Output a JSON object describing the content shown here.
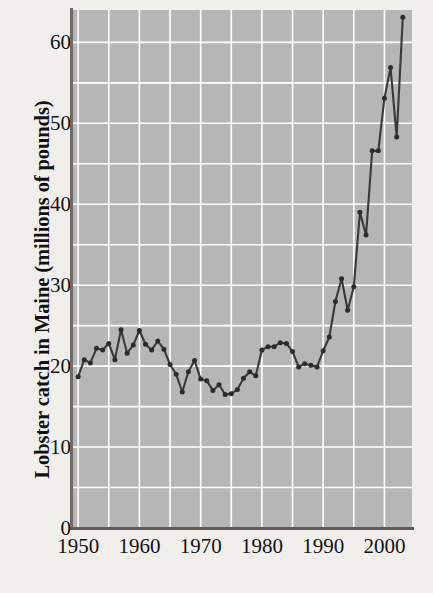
{
  "figure": {
    "background_color": "#f1efec",
    "plot_background_color": "#b6b6b6",
    "gridline_color": "#ffffff",
    "line_color": "#3b3936",
    "marker_color": "#2e2c2a",
    "axis_color": "#5f5c59"
  },
  "axis": {
    "y_title": "Lobster catch in Maine (millions of pounds)",
    "x_title": "",
    "y_ticks": [
      "0",
      "10",
      "20",
      "30",
      "40",
      "50",
      "60"
    ],
    "x_ticks": [
      "1950",
      "1960",
      "1970",
      "1980",
      "1990",
      "2000"
    ]
  },
  "chart_data": {
    "type": "line",
    "title": "",
    "xlabel": "",
    "ylabel": "Lobster catch in Maine (millions of pounds)",
    "xlim": [
      1949,
      2004.5
    ],
    "ylim": [
      0,
      64
    ],
    "yticks": [
      0,
      10,
      20,
      30,
      40,
      50,
      60
    ],
    "xticks": [
      1950,
      1960,
      1970,
      1980,
      1990,
      2000
    ],
    "y_minor_step": 5,
    "x_minor_step": 5,
    "grid": true,
    "legend": false,
    "markers": true,
    "series": [
      {
        "name": "Lobster catch",
        "x": [
          1950,
          1951,
          1952,
          1953,
          1954,
          1955,
          1956,
          1957,
          1958,
          1959,
          1960,
          1961,
          1962,
          1963,
          1964,
          1965,
          1966,
          1967,
          1968,
          1969,
          1970,
          1971,
          1972,
          1973,
          1974,
          1975,
          1976,
          1977,
          1978,
          1979,
          1980,
          1981,
          1982,
          1983,
          1984,
          1985,
          1986,
          1987,
          1988,
          1989,
          1990,
          1991,
          1992,
          1993,
          1994,
          1995,
          1996,
          1997,
          1998,
          1999,
          2000,
          2001,
          2002,
          2003
        ],
        "values": [
          18.7,
          20.8,
          20.4,
          22.2,
          22.0,
          22.8,
          20.8,
          24.5,
          21.6,
          22.6,
          24.4,
          22.7,
          22.0,
          23.1,
          22.1,
          20.2,
          19.0,
          16.8,
          19.3,
          20.7,
          18.4,
          18.2,
          17.0,
          17.7,
          16.5,
          16.6,
          17.1,
          18.5,
          19.3,
          18.8,
          22.0,
          22.4,
          22.4,
          22.9,
          22.8,
          21.8,
          19.9,
          20.3,
          20.1,
          19.9,
          21.9,
          23.6,
          28.0,
          30.8,
          26.9,
          29.8,
          39.0,
          36.2,
          46.6,
          46.6,
          53.1,
          56.9,
          48.3,
          63.1
        ]
      }
    ],
    "annotations": []
  }
}
